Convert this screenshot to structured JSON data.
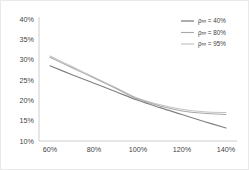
{
  "chart_data": {
    "type": "line",
    "title": "",
    "xlabel": "",
    "ylabel": "",
    "xlim": [
      55,
      145
    ],
    "ylim": [
      10,
      40
    ],
    "xticks": [
      "60%",
      "80%",
      "100%",
      "120%",
      "140%"
    ],
    "xtick_values": [
      60,
      80,
      100,
      120,
      140
    ],
    "yticks": [
      "10%",
      "15%",
      "20%",
      "25%",
      "30%",
      "35%",
      "40%"
    ],
    "ytick_values": [
      10,
      15,
      20,
      25,
      30,
      35,
      40
    ],
    "grid": false,
    "legend_position": "top-right",
    "x": [
      60,
      70,
      80,
      90,
      100,
      110,
      120,
      130,
      140
    ],
    "series": [
      {
        "name": "ρ∞ = 40%",
        "label_symbol": "ρ∞",
        "label_value": "40%",
        "color": "#808080",
        "values": [
          28.5,
          26.3,
          24.2,
          22.1,
          20.0,
          18.2,
          16.5,
          14.8,
          13.2
        ]
      },
      {
        "name": "ρ∞ = 80%",
        "label_symbol": "ρ∞",
        "label_value": "80%",
        "color": "#a8a8a8",
        "values": [
          30.6,
          28.0,
          25.5,
          22.9,
          20.3,
          18.6,
          17.4,
          16.8,
          16.5
        ]
      },
      {
        "name": "ρ∞ = 95%",
        "label_symbol": "ρ∞",
        "label_value": "95%",
        "color": "#c4c4c4",
        "values": [
          30.9,
          28.3,
          25.7,
          23.1,
          20.5,
          18.9,
          17.8,
          17.2,
          17.0
        ]
      }
    ]
  },
  "legend": {
    "entries": [
      {
        "text": "ρ∞ = 40%"
      },
      {
        "text": "ρ∞ = 80%"
      },
      {
        "text": "ρ∞ = 95%"
      }
    ]
  },
  "axes": {
    "y_labels": [
      "40%",
      "35%",
      "30%",
      "25%",
      "20%",
      "15%",
      "10%"
    ],
    "x_labels": [
      "60%",
      "80%",
      "100%",
      "120%",
      "140%"
    ]
  },
  "style": {
    "background": "#ffffff",
    "border_color": "#e9e9e9",
    "axis_color": "#c8c8c8",
    "text_color": "#3f3f3f"
  }
}
